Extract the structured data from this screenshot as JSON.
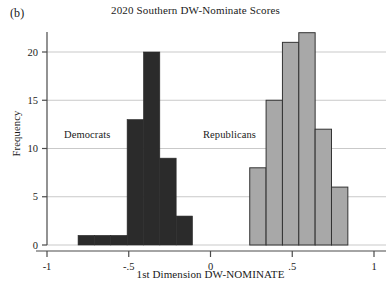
{
  "figure": {
    "panel_label": "(b)",
    "title": "2020 Southern DW-Nominate Scores",
    "xlabel": "1st Dimension DW-NOMINATE",
    "ylabel": "Frequency"
  },
  "annotations": {
    "democrats": "Democrats",
    "republicans": "Republicans"
  },
  "axis": {
    "x_ticks": [
      "-1",
      "-.5",
      "0",
      ".5",
      "1"
    ],
    "y_ticks": [
      "0",
      "5",
      "10",
      "15",
      "20"
    ]
  },
  "colors": {
    "democrat_fill": "#2b2b2b",
    "republican_fill": "#a8a8a8",
    "republican_edge": "#333333",
    "gridline": "#c9c9c9",
    "axis": "#4a4a4a",
    "text": "#1a1a1a",
    "background": "#ffffff"
  },
  "chart_data": {
    "type": "bar",
    "title": "2020 Southern DW-Nominate Scores",
    "xlabel": "1st Dimension DW-NOMINATE",
    "ylabel": "Frequency",
    "xlim": [
      -1,
      1
    ],
    "ylim": [
      0,
      23
    ],
    "grid": true,
    "legend": "annotations-inline",
    "bin_width": 0.1,
    "x_ticks": [
      -1,
      -0.5,
      0,
      0.5,
      1
    ],
    "y_ticks": [
      0,
      5,
      10,
      15,
      20
    ],
    "series": [
      {
        "name": "Democrats",
        "color": "#2b2b2b",
        "bins": [
          {
            "x0": -0.81,
            "x1": -0.71,
            "value": 1
          },
          {
            "x0": -0.71,
            "x1": -0.61,
            "value": 1
          },
          {
            "x0": -0.61,
            "x1": -0.51,
            "value": 1
          },
          {
            "x0": -0.51,
            "x1": -0.41,
            "value": 13
          },
          {
            "x0": -0.41,
            "x1": -0.31,
            "value": 20
          },
          {
            "x0": -0.31,
            "x1": -0.21,
            "value": 9
          },
          {
            "x0": -0.21,
            "x1": -0.11,
            "value": 3
          }
        ]
      },
      {
        "name": "Republicans",
        "color": "#a8a8a8",
        "bins": [
          {
            "x0": 0.24,
            "x1": 0.34,
            "value": 8
          },
          {
            "x0": 0.34,
            "x1": 0.44,
            "value": 15
          },
          {
            "x0": 0.44,
            "x1": 0.54,
            "value": 21
          },
          {
            "x0": 0.54,
            "x1": 0.64,
            "value": 22
          },
          {
            "x0": 0.64,
            "x1": 0.74,
            "value": 12
          },
          {
            "x0": 0.74,
            "x1": 0.84,
            "value": 6
          }
        ]
      }
    ]
  }
}
